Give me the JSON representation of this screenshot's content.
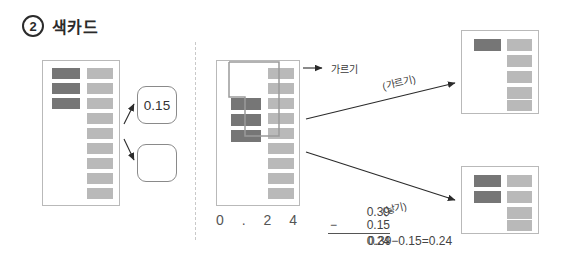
{
  "header": {
    "step_number": "2",
    "title": "색카드"
  },
  "left_panel": {
    "card_name": "source-color-card",
    "dark_bar_count": 3,
    "light_bar_count": 9,
    "colors": {
      "dark": "#767676",
      "light": "#b9b9b9",
      "card_border": "#b9b9b9"
    },
    "answer_boxes": [
      {
        "name": "answer-box-filled",
        "value": "0.15"
      },
      {
        "name": "answer-box-empty",
        "value": ""
      }
    ]
  },
  "middle_panel": {
    "card_name": "split-color-card",
    "dark_bar_count": 3,
    "light_bar_count": 9,
    "selection_label": "가르기",
    "place_value_digits": "0 . 2 4",
    "vertical_subtraction": {
      "minuend": "0.39",
      "operator": "−",
      "subtrahend": "0.15",
      "difference": "0.24"
    },
    "horizontal_equation": "0.39−0.15=0.24"
  },
  "arrow_labels": {
    "upper": "(가르기)",
    "lower": "(낳기)"
  },
  "right_panel": {
    "top_card": {
      "name": "result-card-top",
      "dark_bar_count": 1,
      "light_bar_count": 5
    },
    "bottom_card": {
      "name": "result-card-bottom",
      "dark_bar_count": 2,
      "light_bar_count": 4
    }
  },
  "icons": {
    "arrow_head": "arrow-head-icon",
    "divider": "vertical-dashed-divider"
  }
}
